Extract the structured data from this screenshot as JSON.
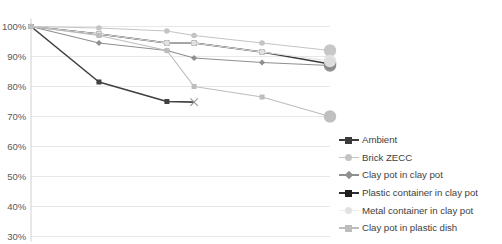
{
  "chart_data": {
    "type": "line",
    "title": "",
    "subtitle": "",
    "xlabel": "",
    "ylabel": "",
    "grid": true,
    "legend_position": "right",
    "ylim": [
      30,
      100
    ],
    "yticks": [
      100,
      90,
      80,
      70,
      60,
      50,
      40,
      30
    ],
    "ytick_labels": [
      "100%",
      "90%",
      "80%",
      "70%",
      "60%",
      "50%",
      "40%",
      "30%"
    ],
    "x": [
      0,
      1,
      2,
      2.4,
      3.4,
      4.4
    ],
    "xtick_labels": [],
    "series": [
      {
        "name": "Ambient",
        "color": "#3b3b3b",
        "marker": "square",
        "values": [
          100,
          97.5,
          94.5,
          94.5,
          91.5,
          87.5
        ]
      },
      {
        "name": "Brick ZECC",
        "color": "#c4c4c4",
        "marker": "circle",
        "values": [
          100,
          99.5,
          98.5,
          97.0,
          94.5,
          92.0
        ]
      },
      {
        "name": "Clay pot in clay pot",
        "color": "#8f8f8f",
        "marker": "diamond",
        "values": [
          100,
          94.5,
          92.0,
          89.5,
          88.0,
          87.0
        ]
      },
      {
        "name": "Plastic container in clay pot",
        "color": "#404040",
        "marker": "square",
        "values": [
          100,
          81.5,
          75.0,
          74.8,
          null,
          null
        ]
      },
      {
        "name": "Metal container in clay pot",
        "color": "#e2e2e2",
        "marker": "circle",
        "values": [
          100,
          97.5,
          94.5,
          94.5,
          91.5,
          88.5
        ]
      },
      {
        "name": "Clay pot in plastic dish",
        "color": "#bdbdbd",
        "marker": "square",
        "values": [
          100,
          97.0,
          92.0,
          80.0,
          76.5,
          70.0
        ]
      }
    ]
  },
  "legend": {
    "items": [
      {
        "label": "Ambient"
      },
      {
        "label": "Brick ZECC"
      },
      {
        "label": "Clay pot in clay pot"
      },
      {
        "label": "Plastic container in clay pot"
      },
      {
        "label": "Metal container in clay pot"
      },
      {
        "label": "Clay pot in plastic dish"
      }
    ]
  }
}
